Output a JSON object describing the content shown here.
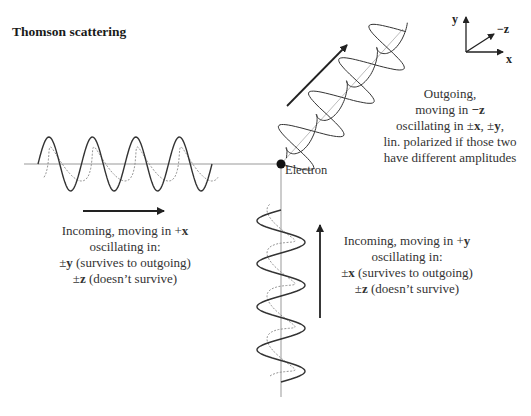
{
  "title": "Thomson scattering",
  "coordinate_axes": {
    "y_label": "y",
    "x_label": "x",
    "z_label": "−z"
  },
  "electron": {
    "label": "Electron"
  },
  "outgoing": {
    "lines": [
      {
        "text": "Outgoing,"
      },
      {
        "pre": "moving in ",
        "bold": "−z",
        "post": ""
      },
      {
        "pre": "oscillating in ±",
        "bold": "x",
        "mid": ", ±",
        "bold2": "y",
        "post": ","
      },
      {
        "text": "lin. polarized if those two"
      },
      {
        "text": "have different amplitudes"
      }
    ]
  },
  "incoming_x": {
    "lines": [
      {
        "pre": "Incoming, moving in +",
        "bold": "x",
        "post": ""
      },
      {
        "text": "oscillating in:"
      },
      {
        "pre": "±",
        "bold": "y",
        "post": " (survives to outgoing)"
      },
      {
        "pre": "±",
        "bold": "z",
        "post": " (doesn’t survive)"
      }
    ]
  },
  "incoming_y": {
    "lines": [
      {
        "pre": "Incoming, moving in +",
        "bold": "y",
        "post": ""
      },
      {
        "text": "oscillating in:"
      },
      {
        "pre": "±",
        "bold": "x",
        "post": " (survives to outgoing)"
      },
      {
        "pre": "±",
        "bold": "z",
        "post": " (doesn’t survive)"
      }
    ]
  },
  "colors": {
    "wave": "#333333",
    "dashed_wave": "#888888",
    "axis_line": "#999999",
    "arrow": "#222222"
  }
}
